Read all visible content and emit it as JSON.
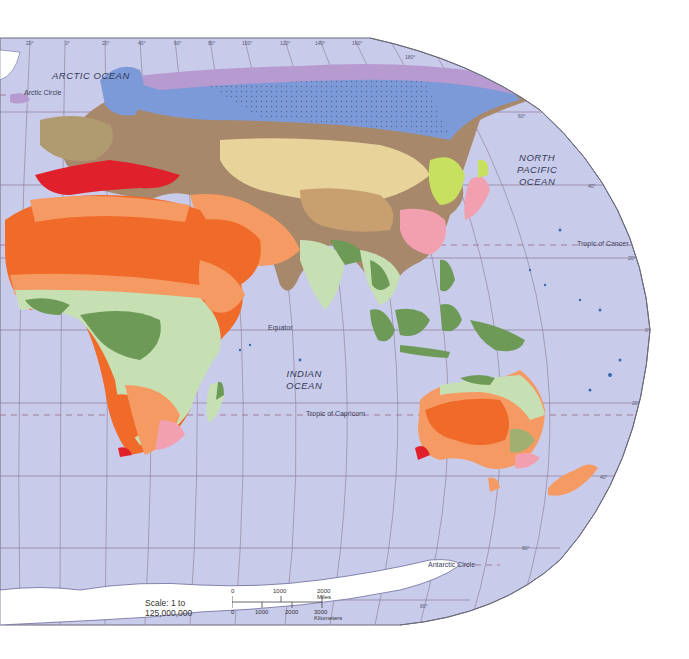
{
  "map": {
    "title": "Climate regions of the Eastern Hemisphere",
    "background_color": "#ffffff",
    "ocean_color": "#c9cbeb",
    "graticule_color": "#8a7a90",
    "ocean_labels": [
      {
        "id": "arctic",
        "text": "ARCTIC  OCEAN"
      },
      {
        "id": "north-pacific",
        "lines": [
          "NORTH",
          "PACIFIC",
          "OCEAN"
        ]
      },
      {
        "id": "indian",
        "lines": [
          "INDIAN",
          "OCEAN"
        ]
      }
    ],
    "line_labels": {
      "arctic_circle": "Arctic Circle",
      "tropic_cancer": "Tropic of Cancer",
      "equator": "Equator",
      "tropic_capricorn": "Tropic of Capricorn",
      "antarctic_circle": "Antarctic Circle"
    },
    "longitude_ticks": [
      "20°",
      "0°",
      "20°",
      "40°",
      "60°",
      "80°",
      "100°",
      "120°",
      "140°",
      "160°",
      "180°"
    ],
    "latitude_ticks": [
      "80°",
      "60°",
      "40°",
      "20°",
      "0°",
      "20°",
      "40°",
      "60°",
      "80°"
    ],
    "climate_colors": {
      "ice_cap": "#b69ad0",
      "subarctic": "#7d9ad8",
      "humid_continental": "#a8886a",
      "mediterranean": "#e0202a",
      "desert": "#f06a2a",
      "steppe": "#f59a62",
      "savanna": "#c6e0b4",
      "tropical_rainforest": "#6e9a58",
      "humid_subtropical": "#f2a0b0",
      "marine_west_coast": "#c8e060",
      "highland": "#e8d49a",
      "ice_sheet": "#ffffff"
    },
    "scale": {
      "text": "Scale:  1 to 125,000,000",
      "miles": [
        "0",
        "1000",
        "2000 Miles"
      ],
      "km": [
        "0",
        "1000",
        "2000",
        "3000 Kilometers"
      ]
    }
  }
}
